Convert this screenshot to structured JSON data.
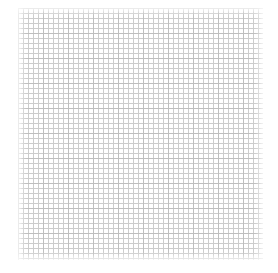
{
  "canvas": {
    "type": "grid-paper",
    "background": "#ffffff",
    "grid_color": "#c4c4c4",
    "major_grid_color": "#a8a8a8",
    "cell_size_px": 5,
    "major_every": 5
  }
}
